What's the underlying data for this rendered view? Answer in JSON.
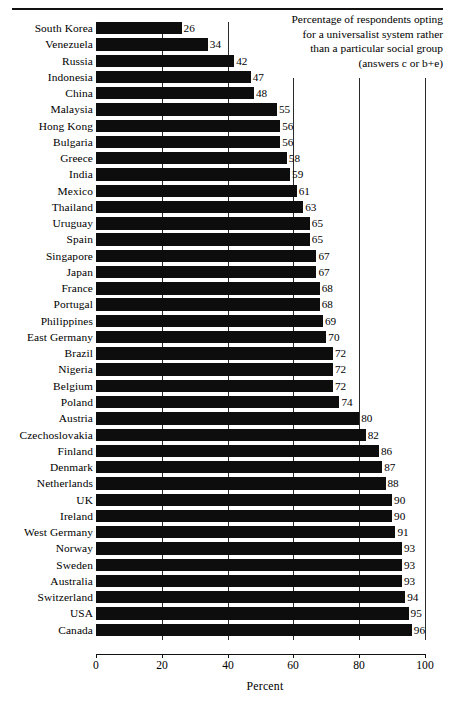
{
  "chart_data": {
    "type": "bar",
    "orientation": "horizontal",
    "title": "",
    "annotation": [
      "Percentage of respondents opting",
      "for a universalist system rather",
      "than a particular social group",
      "(answers c or b+e)"
    ],
    "xlabel": "Percent",
    "ylabel": "",
    "xlim": [
      0,
      100
    ],
    "xticks": [
      0,
      20,
      40,
      60,
      80,
      100
    ],
    "xtick_labels": [
      "0",
      "20",
      "40",
      "60",
      "80",
      "100"
    ],
    "grid": true,
    "grid_axis": "x",
    "legend": null,
    "bar_color": "#0d0d0d",
    "categories": [
      "South Korea",
      "Venezuela",
      "Russia",
      "Indonesia",
      "China",
      "Malaysia",
      "Hong Kong",
      "Bulgaria",
      "Greece",
      "India",
      "Mexico",
      "Thailand",
      "Uruguay",
      "Spain",
      "Singapore",
      "Japan",
      "France",
      "Portugal",
      "Philippines",
      "East Germany",
      "Brazil",
      "Nigeria",
      "Belgium",
      "Poland",
      "Austria",
      "Czechoslovakia",
      "Finland",
      "Denmark",
      "Netherlands",
      "UK",
      "Ireland",
      "West Germany",
      "Norway",
      "Sweden",
      "Australia",
      "Switzerland",
      "USA",
      "Canada"
    ],
    "values": [
      26,
      34,
      42,
      47,
      48,
      55,
      56,
      56,
      58,
      59,
      61,
      63,
      65,
      65,
      67,
      67,
      68,
      68,
      69,
      70,
      72,
      72,
      72,
      74,
      80,
      82,
      86,
      87,
      88,
      90,
      90,
      91,
      93,
      93,
      93,
      94,
      95,
      96
    ],
    "value_labels": [
      "26",
      "34",
      "42",
      "47",
      "48",
      "55",
      "56",
      "56",
      "58",
      "59",
      "61",
      "63",
      "65",
      "65",
      "67",
      "67",
      "68",
      "68",
      "69",
      "70",
      "72",
      "72",
      "72",
      "74",
      "80",
      "82",
      "86",
      "87",
      "88",
      "90",
      "90",
      "91",
      "93",
      "93",
      "93",
      "94",
      "95",
      "96"
    ]
  }
}
